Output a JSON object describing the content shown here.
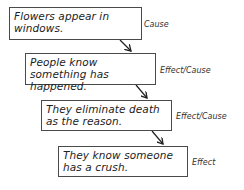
{
  "diagram": {
    "type": "cause-effect chain",
    "steps": [
      {
        "text": "Flowers appear in windows.",
        "role": "Cause"
      },
      {
        "text": "People know something has happened.",
        "role": "Effect/Cause"
      },
      {
        "text": "They eliminate death as the reason.",
        "role": "Effect/Cause"
      },
      {
        "text": "They know someone has a crush.",
        "role": "Effect"
      }
    ],
    "arrows": [
      {
        "from": 0,
        "to": 1,
        "icon": "arrow-down-right-icon"
      },
      {
        "from": 1,
        "to": 2,
        "icon": "arrow-down-right-icon"
      },
      {
        "from": 2,
        "to": 3,
        "icon": "arrow-down-right-icon"
      }
    ],
    "colors": {
      "box_border": "#4a4a4a",
      "text": "#222222",
      "background": "#ffffff"
    }
  }
}
